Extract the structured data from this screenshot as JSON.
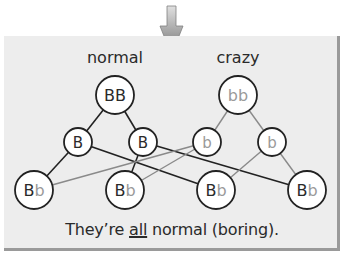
{
  "diagram": {
    "arrow": {
      "direction": "down",
      "icon": "down-arrow-icon",
      "color_top": "#d8d8d8",
      "color_bottom": "#7a7a7a"
    },
    "panel": {
      "background": "#ededed",
      "shadow": "#9a9a9a"
    },
    "columns": [
      {
        "label": "normal",
        "x": 115
      },
      {
        "label": "crazy",
        "x": 238
      }
    ],
    "colors": {
      "normal_stroke": "#222222",
      "crazy_stroke": "#8a8a8a",
      "normal_text": "#2a2a2a",
      "crazy_text": "#9a9a9a",
      "node_fill": "#ffffff"
    },
    "nodes": [
      {
        "id": "BB",
        "label_parts": [
          {
            "t": "BB",
            "c": "normal"
          }
        ],
        "x": 115,
        "y": 95,
        "r": 19,
        "stroke": "normal"
      },
      {
        "id": "bb",
        "label_parts": [
          {
            "t": "bb",
            "c": "crazy"
          }
        ],
        "x": 238,
        "y": 95,
        "r": 19,
        "stroke": "normal"
      },
      {
        "id": "B1",
        "label_parts": [
          {
            "t": "B",
            "c": "normal"
          }
        ],
        "x": 78,
        "y": 142,
        "r": 14,
        "stroke": "normal"
      },
      {
        "id": "B2",
        "label_parts": [
          {
            "t": "B",
            "c": "normal"
          }
        ],
        "x": 143,
        "y": 142,
        "r": 14,
        "stroke": "normal"
      },
      {
        "id": "b1",
        "label_parts": [
          {
            "t": "b",
            "c": "crazy"
          }
        ],
        "x": 207,
        "y": 142,
        "r": 14,
        "stroke": "normal"
      },
      {
        "id": "b2",
        "label_parts": [
          {
            "t": "b",
            "c": "crazy"
          }
        ],
        "x": 272,
        "y": 142,
        "r": 14,
        "stroke": "normal"
      },
      {
        "id": "Bb1",
        "label_parts": [
          {
            "t": "B",
            "c": "normal"
          },
          {
            "t": "b",
            "c": "crazy"
          }
        ],
        "x": 34,
        "y": 190,
        "r": 19,
        "stroke": "normal"
      },
      {
        "id": "Bb2",
        "label_parts": [
          {
            "t": "B",
            "c": "normal"
          },
          {
            "t": "b",
            "c": "crazy"
          }
        ],
        "x": 125,
        "y": 190,
        "r": 19,
        "stroke": "normal"
      },
      {
        "id": "Bb3",
        "label_parts": [
          {
            "t": "B",
            "c": "normal"
          },
          {
            "t": "b",
            "c": "crazy"
          }
        ],
        "x": 216,
        "y": 190,
        "r": 19,
        "stroke": "normal"
      },
      {
        "id": "Bb4",
        "label_parts": [
          {
            "t": "B",
            "c": "normal"
          },
          {
            "t": "b",
            "c": "crazy"
          }
        ],
        "x": 307,
        "y": 190,
        "r": 19,
        "stroke": "normal"
      }
    ],
    "edges": [
      {
        "from": "BB",
        "to": "B1",
        "kind": "normal"
      },
      {
        "from": "BB",
        "to": "B2",
        "kind": "normal"
      },
      {
        "from": "bb",
        "to": "b1",
        "kind": "crazy"
      },
      {
        "from": "bb",
        "to": "b2",
        "kind": "crazy"
      },
      {
        "from": "B1",
        "to": "Bb1",
        "kind": "normal"
      },
      {
        "from": "B1",
        "to": "Bb3",
        "kind": "normal"
      },
      {
        "from": "B2",
        "to": "Bb2",
        "kind": "normal"
      },
      {
        "from": "B2",
        "to": "Bb4",
        "kind": "normal"
      },
      {
        "from": "b1",
        "to": "Bb1",
        "kind": "crazy"
      },
      {
        "from": "b1",
        "to": "Bb2",
        "kind": "crazy"
      },
      {
        "from": "b2",
        "to": "Bb3",
        "kind": "crazy"
      },
      {
        "from": "b2",
        "to": "Bb4",
        "kind": "crazy"
      }
    ],
    "caption": {
      "before": "They’re ",
      "emphasis": "all",
      "after": " normal (boring)."
    }
  }
}
